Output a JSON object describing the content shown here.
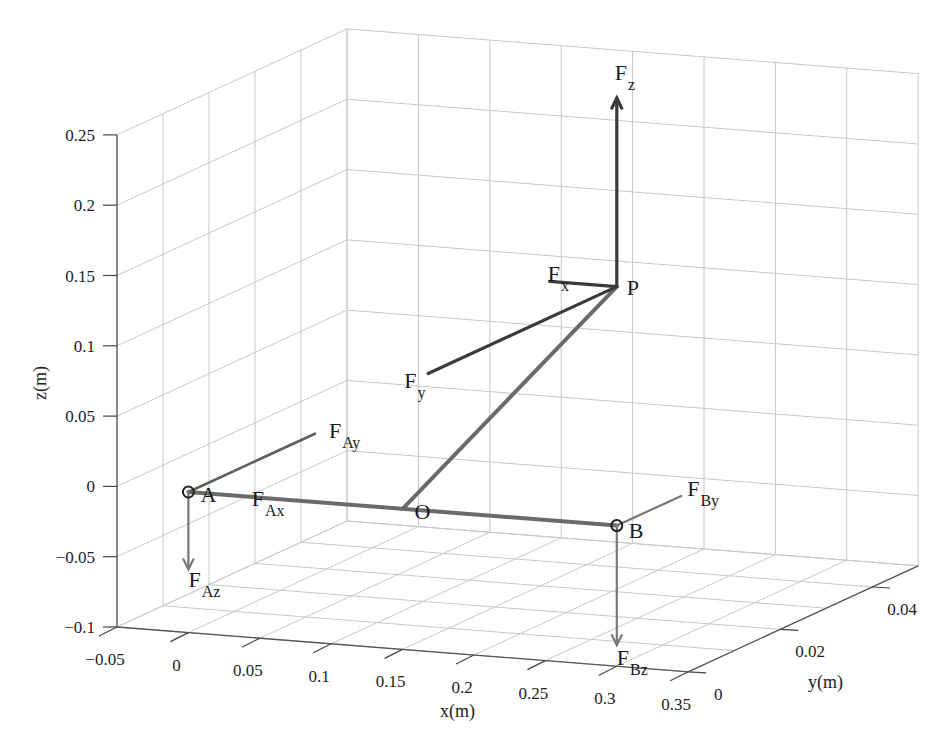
{
  "chart_data": {
    "type": "3d-line",
    "title": "",
    "xlabel": "x(m)",
    "ylabel": "y(m)",
    "zlabel": "z(m)",
    "xlim": [
      -0.05,
      0.35
    ],
    "ylim": [
      0,
      0.05
    ],
    "zlim": [
      -0.1,
      0.25
    ],
    "grid": true,
    "x_ticks": [
      "-0.05",
      "0",
      "0.05",
      "0.1",
      "0.15",
      "0.2",
      "0.25",
      "0.3",
      "0.35"
    ],
    "x_tick_values": [
      -0.05,
      0,
      0.05,
      0.1,
      0.15,
      0.2,
      0.25,
      0.3,
      0.35
    ],
    "y_ticks": [
      "0",
      "0.02",
      "0.04"
    ],
    "y_tick_values": [
      0,
      0.02,
      0.04
    ],
    "z_ticks": [
      "0.25",
      "0.2",
      "0.15",
      "0.1",
      "0.05",
      "0",
      "-0.05",
      "-0.1"
    ],
    "z_tick_values": [
      0.25,
      0.2,
      0.15,
      0.1,
      0.05,
      0,
      -0.05,
      -0.1
    ],
    "points": {
      "A": [
        0,
        0,
        0
      ],
      "O": [
        0.15,
        0,
        0
      ],
      "B": [
        0.3,
        0,
        0
      ],
      "P": [
        0.3,
        0,
        0.17
      ]
    },
    "members": [
      {
        "from": "A",
        "to": "B",
        "style": "member"
      },
      {
        "from": "O",
        "to": "P",
        "style": "member"
      }
    ],
    "forces": [
      {
        "name": "Fz",
        "main": "F",
        "sub": "z",
        "at": "P",
        "vec": [
          0,
          0,
          0.134
        ],
        "arrow": true,
        "style": "force-dark",
        "label_offset": [
          -2,
          -18
        ]
      },
      {
        "name": "Fx",
        "main": "F",
        "sub": "x",
        "at": "P",
        "vec": [
          -0.047,
          0,
          0
        ],
        "arrow": false,
        "style": "force-dark",
        "label_offset": [
          -2,
          0
        ]
      },
      {
        "name": "Fy",
        "main": "F",
        "sub": "y",
        "at": "P",
        "vec": [
          0,
          -0.041,
          0
        ],
        "arrow": false,
        "style": "force-dark",
        "label_offset": [
          -24,
          14
        ]
      },
      {
        "name": "FAy",
        "main": "F",
        "sub": "Ay",
        "at": "A",
        "vec": [
          0,
          0.0275,
          0
        ],
        "arrow": false,
        "style": "force-mid",
        "label_offset": [
          14,
          4
        ]
      },
      {
        "name": "FAx",
        "main": "F",
        "sub": "Ax",
        "at": "A",
        "vec": [
          0.05,
          0,
          0
        ],
        "arrow": false,
        "style": "none",
        "label_offset": [
          -8,
          8
        ]
      },
      {
        "name": "FAz",
        "main": "F",
        "sub": "Az",
        "at": "A",
        "vec": [
          0,
          0,
          -0.055
        ],
        "arrow": true,
        "style": "force-light",
        "label_offset": [
          0,
          18
        ]
      },
      {
        "name": "FBy",
        "main": "F",
        "sub": "By",
        "at": "B",
        "vec": [
          0,
          0.014,
          0
        ],
        "arrow": false,
        "style": "force-light",
        "label_offset": [
          6,
          0
        ]
      },
      {
        "name": "FBz",
        "main": "F",
        "sub": "Bz",
        "at": "B",
        "vec": [
          0,
          0,
          -0.085
        ],
        "arrow": true,
        "style": "force-light",
        "label_offset": [
          0,
          20
        ]
      }
    ],
    "point_labels": [
      {
        "text": "A",
        "at": "A",
        "offset": [
          18,
          10
        ],
        "marker": true
      },
      {
        "text": "O",
        "at": "O",
        "offset": [
          18,
          10
        ],
        "marker": false
      },
      {
        "text": "B",
        "at": "B",
        "offset": [
          18,
          12
        ],
        "marker": true
      },
      {
        "text": "P",
        "at": "P",
        "offset": [
          16,
          8
        ],
        "marker": false
      }
    ],
    "colors": {
      "grid": "#c8c8c8",
      "axis": "#555555",
      "member": "#6a6a6a",
      "force_dark": "#3a3a3a",
      "text": "#1a1a1a"
    }
  }
}
